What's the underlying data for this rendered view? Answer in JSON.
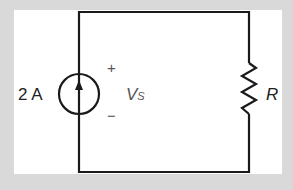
{
  "diagram": {
    "type": "circuit",
    "source": {
      "kind": "current-source",
      "value_label": "2 A",
      "direction": "up"
    },
    "voltage": {
      "plus": "+",
      "minus": "−",
      "symbol": "V",
      "subscript": "S"
    },
    "resistor": {
      "label": "R"
    },
    "colors": {
      "background": "#d9d9d9",
      "panel": "#ffffff",
      "wire": "#1a1a1a"
    }
  }
}
